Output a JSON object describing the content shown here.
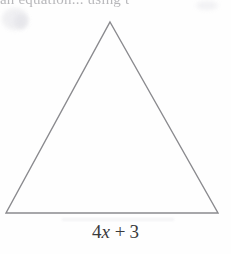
{
  "figure": {
    "type": "geometry-diagram",
    "shape": "triangle",
    "shape_description": "isosceles triangle",
    "stroke_color": "#8a8a8e",
    "background_color": "#fefefe",
    "text_color": "#3a3a3c",
    "vertices": {
      "apex": {
        "x": 110,
        "y": 22
      },
      "bottom_left": {
        "x": 6,
        "y": 213
      },
      "bottom_right": {
        "x": 218,
        "y": 213
      }
    },
    "base_label": {
      "full_text": "4x + 3",
      "coefficient": "4",
      "variable": "x",
      "operator": "+",
      "constant": "3"
    }
  },
  "cropped_header": {
    "text": "an equation... using t"
  }
}
